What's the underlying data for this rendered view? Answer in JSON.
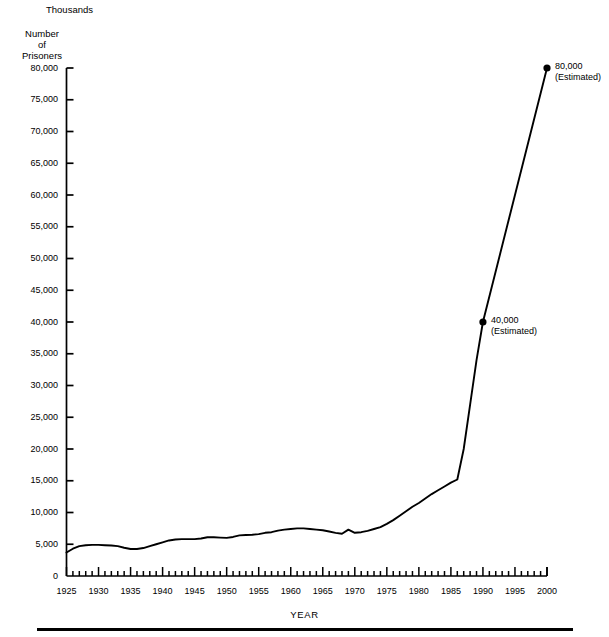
{
  "header": {
    "units_label": "Thousands",
    "y_axis_title_lines": [
      "Number",
      "of",
      "Prisoners"
    ]
  },
  "axis_caption": "YEAR",
  "annotations": [
    {
      "name": "point-1990",
      "value_label": "40,000",
      "qualifier": "(Estimated)",
      "x": 1990,
      "y": 40000
    },
    {
      "name": "point-2000",
      "value_label": "80,000",
      "qualifier": "(Estimated)",
      "x": 2000,
      "y": 80000
    }
  ],
  "chart_data": {
    "type": "line",
    "title": "",
    "xlabel": "YEAR",
    "ylabel": "Number of Prisoners",
    "units": "Thousands",
    "xlim": [
      1925,
      2000
    ],
    "ylim": [
      0,
      80000
    ],
    "xticks": [
      1925,
      1930,
      1935,
      1940,
      1945,
      1950,
      1955,
      1960,
      1965,
      1970,
      1975,
      1980,
      1985,
      1990,
      1995,
      2000
    ],
    "xtick_labels": [
      "1925",
      "1930",
      "1935",
      "1940",
      "1945",
      "1950",
      "1955",
      "1960",
      "1965",
      "1970",
      "1975",
      "1980",
      "1985",
      "1990",
      "1995",
      "2000"
    ],
    "x_minor_tick_interval": 1,
    "yticks": [
      0,
      5000,
      10000,
      15000,
      20000,
      25000,
      30000,
      35000,
      40000,
      45000,
      50000,
      55000,
      60000,
      65000,
      70000,
      75000,
      80000
    ],
    "ytick_labels": [
      "0",
      "5,000",
      "10,000",
      "15,000",
      "20,000",
      "25,000",
      "30,000",
      "35,000",
      "40,000",
      "45,000",
      "50,000",
      "55,000",
      "60,000",
      "65,000",
      "70,000",
      "75,000",
      "80,000"
    ],
    "grid": false,
    "legend": null,
    "line_color": "#000000",
    "marker_points": [
      {
        "x": 1990,
        "y": 40000
      },
      {
        "x": 2000,
        "y": 80000
      }
    ],
    "x": [
      1925,
      1926,
      1927,
      1928,
      1929,
      1930,
      1931,
      1932,
      1933,
      1934,
      1935,
      1936,
      1937,
      1938,
      1939,
      1940,
      1941,
      1942,
      1943,
      1944,
      1945,
      1946,
      1947,
      1948,
      1949,
      1950,
      1951,
      1952,
      1953,
      1954,
      1955,
      1956,
      1957,
      1958,
      1959,
      1960,
      1961,
      1962,
      1963,
      1964,
      1965,
      1966,
      1967,
      1968,
      1969,
      1970,
      1971,
      1972,
      1973,
      1974,
      1975,
      1976,
      1977,
      1978,
      1979,
      1980,
      1981,
      1982,
      1983,
      1984,
      1985,
      1986,
      1987,
      1988,
      1989,
      1990,
      1995,
      2000
    ],
    "values": [
      3700,
      4300,
      4700,
      4850,
      4900,
      4900,
      4850,
      4800,
      4700,
      4450,
      4250,
      4250,
      4400,
      4700,
      5000,
      5300,
      5600,
      5750,
      5800,
      5800,
      5800,
      5900,
      6100,
      6100,
      6050,
      6000,
      6150,
      6400,
      6450,
      6500,
      6600,
      6800,
      6900,
      7150,
      7300,
      7400,
      7500,
      7500,
      7400,
      7300,
      7200,
      7000,
      6800,
      6650,
      7300,
      6800,
      6900,
      7100,
      7400,
      7700,
      8200,
      8800,
      9500,
      10200,
      10900,
      11500,
      12200,
      12900,
      13500,
      14100,
      14700,
      15200,
      20000,
      27000,
      34000,
      40000,
      60000,
      80000
    ]
  }
}
